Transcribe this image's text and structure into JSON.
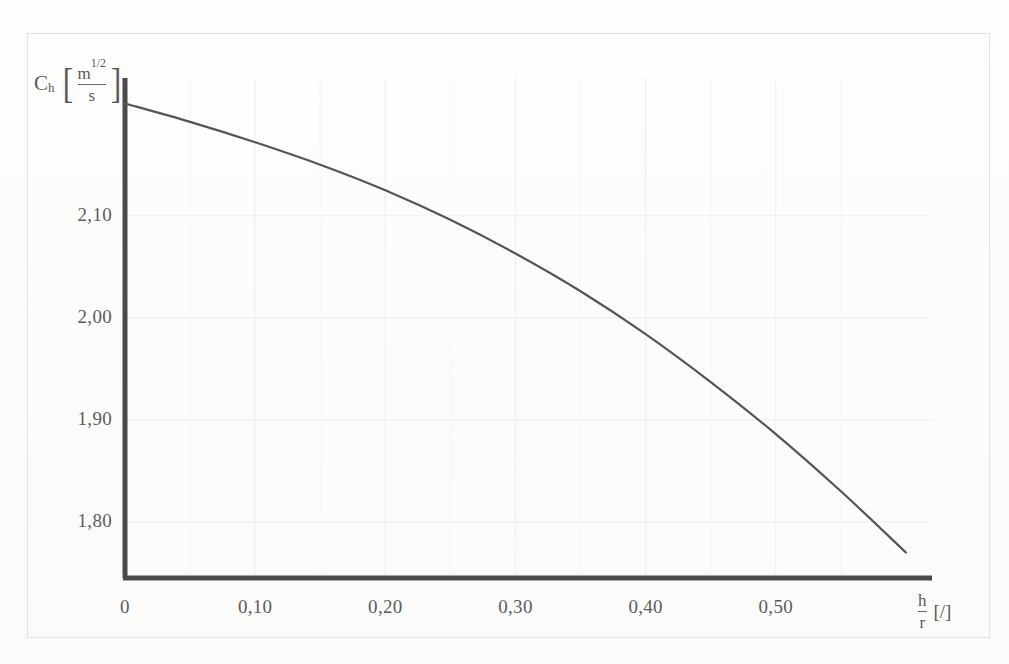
{
  "figure": {
    "background_color": "#fdfdfb",
    "frame_color": "#e2e2de",
    "axis_color": "#4a4a4a",
    "curve_color": "#555555",
    "grid_color": "#eff0ef",
    "label_color": "#5c5c5c"
  },
  "y_axis": {
    "symbol": "C",
    "subscript": "h",
    "unit_numerator": "m",
    "unit_numerator_exponent": "1/2",
    "unit_denominator": "s",
    "bracket_open": "[",
    "bracket_close": "]",
    "ticks": [
      "2,10",
      "2,00",
      "1,90",
      "1,80"
    ],
    "tick_values": [
      2.1,
      2.0,
      1.9,
      1.8
    ]
  },
  "x_axis": {
    "numerator": "h",
    "denominator": "r",
    "unit": "[/]",
    "ticks": [
      "0",
      "0,10",
      "0,20",
      "0,30",
      "0,40",
      "0,50"
    ],
    "tick_values": [
      0.0,
      0.1,
      0.2,
      0.3,
      0.4,
      0.5
    ]
  },
  "chart_data": {
    "type": "line",
    "title": "",
    "subtitle": "",
    "xlabel": "h/r [/]",
    "ylabel": "C_h [m^1/2 / s]",
    "xlim": [
      0.0,
      0.62
    ],
    "ylim": [
      1.745,
      2.235
    ],
    "xticks": [
      0.0,
      0.1,
      0.2,
      0.3,
      0.4,
      0.5
    ],
    "xticklabels": [
      "0",
      "0,10",
      "0,20",
      "0,30",
      "0,40",
      "0,50"
    ],
    "yticks": [
      1.8,
      1.9,
      2.0,
      2.1
    ],
    "yticklabels": [
      "1,80",
      "1,90",
      "2,00",
      "2,10"
    ],
    "grid": true,
    "legend": null,
    "series": [
      {
        "name": "Ch vs h/r",
        "color": "#555555",
        "linewidth": 2.2,
        "x": [
          0.0,
          0.05,
          0.1,
          0.15,
          0.2,
          0.25,
          0.3,
          0.35,
          0.4,
          0.45,
          0.5,
          0.55,
          0.6
        ],
        "y": [
          2.21,
          2.192,
          2.172,
          2.15,
          2.125,
          2.096,
          2.063,
          2.026,
          1.984,
          1.937,
          1.886,
          1.83,
          1.77
        ]
      }
    ],
    "annotations": []
  }
}
